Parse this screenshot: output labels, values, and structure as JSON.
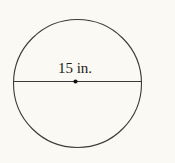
{
  "figure": {
    "type": "geometry-diagram",
    "shape": "circle",
    "diameter_label": "15 in.",
    "diameter_value": 15,
    "diameter_unit": "in.",
    "colors": {
      "background": "#faf9f3",
      "stroke": "#3a3a3a",
      "text": "#1c1c1c",
      "center_dot": "#111111"
    }
  }
}
